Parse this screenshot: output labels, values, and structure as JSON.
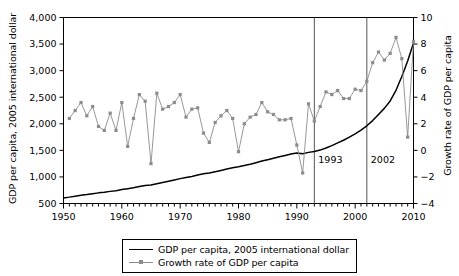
{
  "chart_data": {
    "type": "line",
    "title": "",
    "subtitle": "",
    "xlabel": "",
    "ylabel": "GDP per capita, 2005 international dollar",
    "ylabel_secondary": "Growth rate of GDP per capita",
    "xlim": [
      1950,
      2010
    ],
    "ylim": [
      500,
      4000
    ],
    "ylim_secondary": [
      -4,
      10
    ],
    "grid": false,
    "legend_position": "bottom-center",
    "x_ticks": [
      1950,
      1960,
      1970,
      1980,
      1990,
      2000,
      2010
    ],
    "x_tick_labels": [
      "1950",
      "1960",
      "1970",
      "1980",
      "1990",
      "2000",
      "2010"
    ],
    "x_minor_tick_step": 1,
    "y_ticks": [
      500,
      1000,
      1500,
      2000,
      2500,
      3000,
      3500,
      4000
    ],
    "y_tick_labels": [
      "500",
      "1,000",
      "1,500",
      "2,000",
      "2,500",
      "3,000",
      "3,500",
      "4,000"
    ],
    "y_ticks_secondary": [
      -4,
      -2,
      0,
      2,
      4,
      6,
      8,
      10
    ],
    "y_tick_labels_secondary": [
      "−4",
      "−2",
      "0",
      "2",
      "4",
      "6",
      "8",
      "10"
    ],
    "annotations": [
      {
        "label": "1993",
        "x": 1993,
        "type": "vertical-line"
      },
      {
        "label": "2002",
        "x": 2002,
        "type": "vertical-line"
      }
    ],
    "series": [
      {
        "name": "GDP per capita, 2005 international dollar",
        "axis": "left",
        "color": "#000000",
        "marker": "none",
        "x": [
          1950,
          1951,
          1952,
          1953,
          1954,
          1955,
          1956,
          1957,
          1958,
          1959,
          1960,
          1961,
          1962,
          1963,
          1964,
          1965,
          1966,
          1967,
          1968,
          1969,
          1970,
          1971,
          1972,
          1973,
          1974,
          1975,
          1976,
          1977,
          1978,
          1979,
          1980,
          1981,
          1982,
          1983,
          1984,
          1985,
          1986,
          1987,
          1988,
          1989,
          1990,
          1991,
          1992,
          1993,
          1994,
          1995,
          1996,
          1997,
          1998,
          1999,
          2000,
          2001,
          2002,
          2003,
          2004,
          2005,
          2006,
          2007,
          2008,
          2009,
          2010
        ],
        "values": [
          605,
          620,
          638,
          655,
          668,
          685,
          700,
          712,
          728,
          742,
          762,
          778,
          795,
          818,
          840,
          848,
          872,
          895,
          918,
          942,
          968,
          988,
          1010,
          1038,
          1060,
          1075,
          1098,
          1122,
          1148,
          1172,
          1192,
          1215,
          1240,
          1268,
          1298,
          1325,
          1352,
          1378,
          1405,
          1432,
          1452,
          1438,
          1462,
          1478,
          1505,
          1545,
          1590,
          1640,
          1690,
          1748,
          1812,
          1880,
          1962,
          2060,
          2175,
          2290,
          2430,
          2630,
          2890,
          3180,
          3520
        ]
      },
      {
        "name": "Growth rate of GDP per capita",
        "axis": "right",
        "color": "#8c8c8c",
        "marker": "square",
        "x": [
          1951,
          1952,
          1953,
          1954,
          1955,
          1956,
          1957,
          1958,
          1959,
          1960,
          1961,
          1962,
          1963,
          1964,
          1965,
          1966,
          1967,
          1968,
          1969,
          1970,
          1971,
          1972,
          1973,
          1974,
          1975,
          1976,
          1977,
          1978,
          1979,
          1980,
          1981,
          1982,
          1983,
          1984,
          1985,
          1986,
          1987,
          1988,
          1989,
          1990,
          1991,
          1992,
          1993,
          1994,
          1995,
          1996,
          1997,
          1998,
          1999,
          2000,
          2001,
          2002,
          2003,
          2004,
          2005,
          2006,
          2007,
          2008,
          2009,
          2010
        ],
        "values": [
          2.4,
          3.0,
          3.6,
          2.6,
          3.3,
          1.8,
          1.5,
          2.8,
          1.5,
          3.6,
          0.3,
          2.4,
          4.2,
          3.7,
          -1.0,
          4.3,
          3.1,
          3.3,
          3.6,
          4.2,
          2.5,
          3.1,
          3.2,
          1.3,
          0.6,
          2.1,
          2.6,
          3.0,
          2.4,
          -0.1,
          2.0,
          2.5,
          2.7,
          3.6,
          2.9,
          2.7,
          2.3,
          2.3,
          2.4,
          0.4,
          -1.7,
          3.5,
          2.2,
          3.3,
          4.4,
          4.2,
          4.5,
          3.9,
          3.9,
          4.6,
          4.5,
          5.2,
          6.6,
          7.4,
          6.8,
          7.3,
          8.5,
          6.9,
          1.0,
          8.2
        ]
      }
    ]
  },
  "axes": {
    "left_title": "GDP per capita, 2005 international dollar",
    "right_title": "Growth rate of GDP per capita"
  },
  "legend": {
    "items": [
      {
        "label": "GDP per capita, 2005 international dollar",
        "style": "solid-line",
        "color": "#000000"
      },
      {
        "label": "Growth rate of GDP per capita",
        "style": "line-with-square-marker",
        "color": "#8c8c8c"
      }
    ]
  },
  "colors": {
    "gdp_line": "#000000",
    "growth_line": "#8c8c8c",
    "axis": "#000000",
    "background": "#ffffff",
    "event_line": "#555555"
  }
}
